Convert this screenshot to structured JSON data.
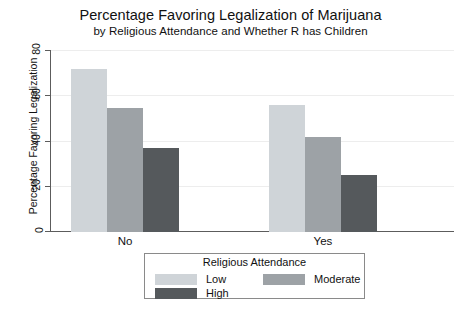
{
  "chart_data": {
    "type": "bar",
    "title": "Percentage Favoring Legalization of Marijuana",
    "subtitle": "by Religious Attendance and Whether R has Children",
    "xlabel": "",
    "ylabel": "Percentage Favoring Legalization",
    "categories": [
      "No",
      "Yes"
    ],
    "series": [
      {
        "name": "Low",
        "values": [
          72,
          56
        ],
        "color": "#cfd4d8"
      },
      {
        "name": "Moderate",
        "values": [
          55,
          42
        ],
        "color": "#9da2a6"
      },
      {
        "name": "High",
        "values": [
          37,
          25
        ],
        "color": "#55595c"
      }
    ],
    "ylim": [
      0,
      80
    ],
    "yticks": [
      0,
      20,
      40,
      60,
      80
    ],
    "grid": true,
    "legend": {
      "title": "Religious Attendance",
      "position": "bottom",
      "entries": [
        {
          "label": "Low",
          "color": "#cfd4d8"
        },
        {
          "label": "Moderate",
          "color": "#9da2a6"
        },
        {
          "label": "High",
          "color": "#55595c"
        }
      ]
    }
  }
}
